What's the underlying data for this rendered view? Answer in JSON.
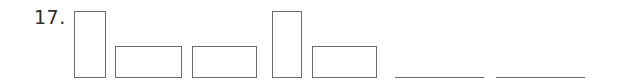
{
  "question": {
    "number_label": "17.",
    "shapes": [
      {
        "type": "tall-rectangle",
        "x": 74,
        "y": 11,
        "w": 32,
        "h": 67
      },
      {
        "type": "wide-rectangle",
        "x": 115,
        "y": 46,
        "w": 67,
        "h": 32
      },
      {
        "type": "wide-rectangle",
        "x": 192,
        "y": 46,
        "w": 65,
        "h": 32
      },
      {
        "type": "tall-rectangle",
        "x": 272,
        "y": 11,
        "w": 30,
        "h": 67
      },
      {
        "type": "wide-rectangle",
        "x": 312,
        "y": 46,
        "w": 65,
        "h": 32
      }
    ],
    "answer_blanks": [
      {
        "x": 395,
        "y": 78,
        "w": 89,
        "value": ""
      },
      {
        "x": 496,
        "y": 78,
        "w": 89,
        "value": ""
      }
    ]
  }
}
